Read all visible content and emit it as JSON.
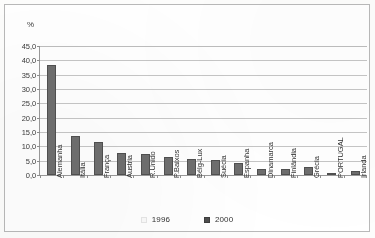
{
  "chart_data": {
    "type": "bar",
    "title": "",
    "subtitle": "",
    "xlabel": "",
    "ylabel": "%",
    "ylim": [
      0,
      45
    ],
    "ytick_step": 5,
    "grid": true,
    "legend_position": "bottom",
    "categories": [
      "Alemanha",
      "Itália",
      "França",
      "Áustria",
      "R.Unido",
      "P.Baixos",
      "Bélg-Lux",
      "Suécia",
      "Espanha",
      "Dinamarca",
      "Finlândia",
      "Grécia",
      "PORTUGAL",
      "Irlanda"
    ],
    "ytick_labels": [
      "45,0",
      "40,0",
      "35,0",
      "30,0",
      "25,0",
      "20,0",
      "15,0",
      "10,0",
      "5,0",
      "0,0"
    ],
    "series": [
      {
        "name": "1996",
        "color": "#fafafa",
        "values": [
          0,
          0,
          0,
          0,
          0,
          0,
          0,
          0,
          0,
          0,
          0,
          0,
          0,
          0
        ]
      },
      {
        "name": "2000",
        "color": "#6d6d6d",
        "values": [
          38.3,
          13.5,
          11.5,
          7.8,
          7.5,
          6.3,
          5.6,
          5.3,
          4.3,
          2.2,
          2.0,
          2.8,
          0.3,
          1.5
        ]
      }
    ]
  },
  "legend": {
    "items": [
      {
        "label": "1996",
        "swatch": "legend-swatch-1996"
      },
      {
        "label": "2000",
        "swatch": "legend-swatch-2000"
      }
    ]
  },
  "axis": {
    "unit_caption": "%"
  },
  "colors": {
    "bar_2000": "#6d6d6d",
    "bar_1996": "#fafafa",
    "gridline": "#c6c6c6",
    "axis": "#9a9a9a",
    "frame": "#b9b9b9",
    "text": "#333333"
  }
}
